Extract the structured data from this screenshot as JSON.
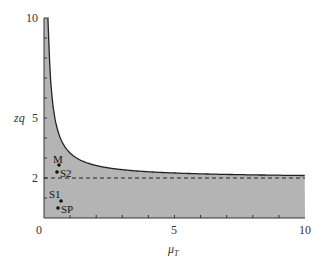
{
  "chart_data": {
    "type": "area",
    "title": "",
    "xlabel": "μ_T",
    "ylabel": "zq",
    "xlim": [
      0,
      10
    ],
    "ylim": [
      0,
      10
    ],
    "x_ticks": [
      0,
      5,
      10
    ],
    "y_ticks": [
      2,
      5,
      10
    ],
    "grid": false,
    "shaded_region": "area below curve zq ≈ 2 + 1.25/μ_T (gray)",
    "curve": {
      "name": "boundary",
      "x": [
        0.13,
        0.2,
        0.3,
        0.42,
        0.6,
        0.8,
        1.0,
        1.5,
        2.0,
        3.0,
        4.0,
        5.0,
        6.0,
        8.0,
        10.0
      ],
      "y": [
        10.0,
        8.25,
        6.17,
        4.98,
        4.08,
        3.56,
        3.25,
        2.83,
        2.63,
        2.42,
        2.31,
        2.25,
        2.21,
        2.16,
        2.13
      ]
    },
    "asymptote": {
      "y": 2,
      "style": "dashed"
    },
    "points": [
      {
        "label": "M",
        "x": 0.58,
        "y": 2.65
      },
      {
        "label": "S2",
        "x": 0.5,
        "y": 2.3
      },
      {
        "label": "S1",
        "x": 0.6,
        "y": 0.85
      },
      {
        "label": "SP",
        "x": 0.5,
        "y": 0.5
      }
    ],
    "colors": {
      "fill": "#b4b4b4",
      "line": "#222222"
    }
  },
  "labels": {
    "x0": "0",
    "x5": "5",
    "x10": "10",
    "y2": "2",
    "y5": "5",
    "y10": "10",
    "xlabel_main": "μ",
    "xlabel_sub": "T",
    "ylabel": "zq",
    "M": "M",
    "S2": "S2",
    "S1": "S1",
    "SP": "SP"
  }
}
